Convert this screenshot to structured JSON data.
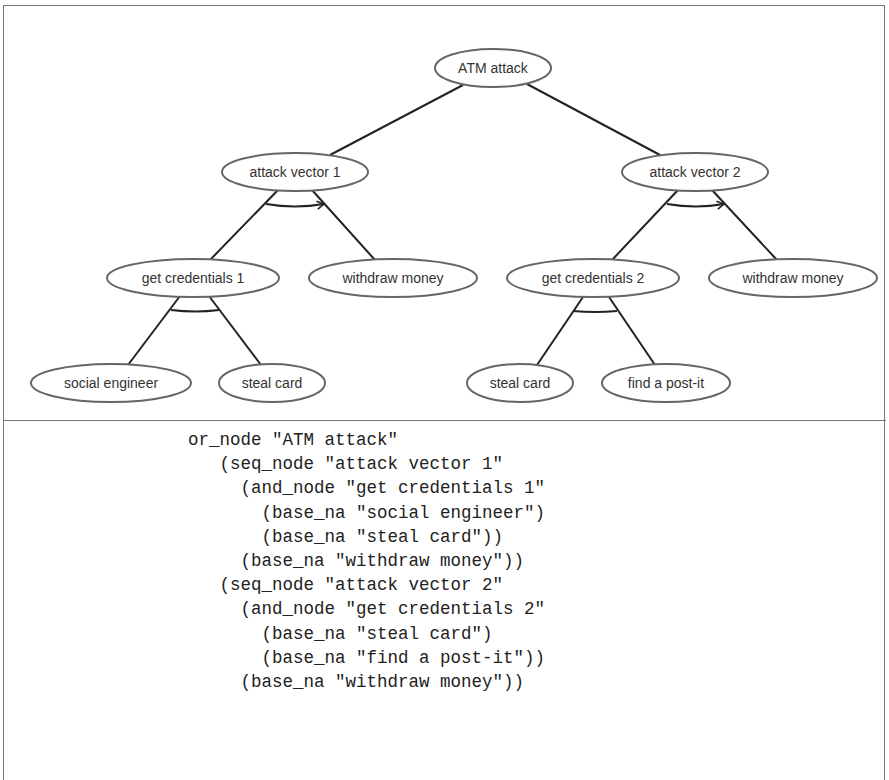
{
  "tree": {
    "nodes": [
      {
        "id": "root",
        "label": "ATM attack",
        "type": "or",
        "cx": 493,
        "cy": 68,
        "rx": 58,
        "ry": 19
      },
      {
        "id": "av1",
        "label": "attack vector 1",
        "type": "seq",
        "cx": 295,
        "cy": 172,
        "rx": 73,
        "ry": 19
      },
      {
        "id": "av2",
        "label": "attack vector 2",
        "type": "seq",
        "cx": 695,
        "cy": 172,
        "rx": 73,
        "ry": 19
      },
      {
        "id": "gc1",
        "label": "get credentials 1",
        "type": "and",
        "cx": 193,
        "cy": 278,
        "rx": 86,
        "ry": 19
      },
      {
        "id": "wm1",
        "label": "withdraw money",
        "type": "base",
        "cx": 393,
        "cy": 278,
        "rx": 84,
        "ry": 19
      },
      {
        "id": "gc2",
        "label": "get credentials 2",
        "type": "and",
        "cx": 593,
        "cy": 278,
        "rx": 86,
        "ry": 19
      },
      {
        "id": "wm2",
        "label": "withdraw money",
        "type": "base",
        "cx": 793,
        "cy": 278,
        "rx": 84,
        "ry": 19
      },
      {
        "id": "se",
        "label": "social engineer",
        "type": "base",
        "cx": 111,
        "cy": 383,
        "rx": 80,
        "ry": 19
      },
      {
        "id": "sc1",
        "label": "steal card",
        "type": "base",
        "cx": 272,
        "cy": 383,
        "rx": 53,
        "ry": 19
      },
      {
        "id": "sc2",
        "label": "steal card",
        "type": "base",
        "cx": 520,
        "cy": 383,
        "rx": 53,
        "ry": 19
      },
      {
        "id": "fp",
        "label": "find a post-it",
        "type": "base",
        "cx": 666,
        "cy": 383,
        "rx": 64,
        "ry": 19
      }
    ],
    "edges": [
      {
        "from": "root",
        "to": "av1",
        "x1": 463,
        "y1": 85,
        "x2": 330,
        "y2": 155
      },
      {
        "from": "root",
        "to": "av2",
        "x1": 527,
        "y1": 84,
        "x2": 660,
        "y2": 155
      },
      {
        "from": "av1",
        "to": "gc1",
        "x1": 278,
        "y1": 190,
        "x2": 210,
        "y2": 260
      },
      {
        "from": "av1",
        "to": "wm1",
        "x1": 312,
        "y1": 190,
        "x2": 375,
        "y2": 260
      },
      {
        "from": "av2",
        "to": "gc2",
        "x1": 678,
        "y1": 190,
        "x2": 612,
        "y2": 260
      },
      {
        "from": "av2",
        "to": "wm2",
        "x1": 712,
        "y1": 190,
        "x2": 777,
        "y2": 260
      },
      {
        "from": "gc1",
        "to": "se",
        "x1": 180,
        "y1": 296,
        "x2": 128,
        "y2": 365
      },
      {
        "from": "gc1",
        "to": "sc1",
        "x1": 209,
        "y1": 296,
        "x2": 261,
        "y2": 365
      },
      {
        "from": "gc2",
        "to": "sc2",
        "x1": 583,
        "y1": 297,
        "x2": 537,
        "y2": 365
      },
      {
        "from": "gc2",
        "to": "fp",
        "x1": 609,
        "y1": 297,
        "x2": 655,
        "y2": 365
      }
    ],
    "connectors": [
      {
        "node": "av1",
        "kind": "seq-arrow",
        "path": "M266,204 Q295,209 324,204"
      },
      {
        "node": "av2",
        "kind": "seq-arrow",
        "path": "M667,204 Q696,209 724,204"
      },
      {
        "node": "gc1",
        "kind": "and-arc",
        "path": "M171,310 Q196,313 219,310"
      },
      {
        "node": "gc2",
        "kind": "and-arc",
        "path": "M573,311 Q595,313 617,311"
      }
    ]
  },
  "code": {
    "lines": [
      {
        "indent": "",
        "text": "or_node \"ATM attack\""
      },
      {
        "indent": "   ",
        "text": "(seq_node \"attack vector 1\""
      },
      {
        "indent": "     ",
        "text": "(and_node \"get credentials 1\""
      },
      {
        "indent": "       ",
        "text": "(base_na \"social engineer\")"
      },
      {
        "indent": "       ",
        "text": "(base_na \"steal card\"))"
      },
      {
        "indent": "     ",
        "text": "(base_na \"withdraw money\"))"
      },
      {
        "indent": "   ",
        "text": "(seq_node \"attack vector 2\""
      },
      {
        "indent": "     ",
        "text": "(and_node \"get credentials 2\""
      },
      {
        "indent": "       ",
        "text": "(base_na \"steal card\")"
      },
      {
        "indent": "       ",
        "text": "(base_na \"find a post-it\"))"
      },
      {
        "indent": "     ",
        "text": "(base_na \"withdraw money\"))"
      }
    ]
  }
}
